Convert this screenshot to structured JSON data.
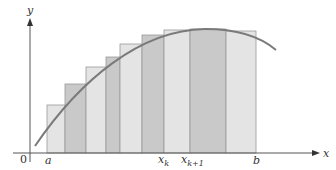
{
  "figure": {
    "axes": {
      "x_label": "x",
      "y_label": "y",
      "origin_label": "0"
    },
    "tick_labels": {
      "a": "a",
      "xk": "x",
      "xk_sub": "k",
      "xk1": "x",
      "xk1_sub": "k+1",
      "b": "b"
    },
    "colors": {
      "axis": "#555555",
      "curve": "#7a7a7a",
      "light_rect": "#e4e4e4",
      "dark_rect": "#c9c9c9",
      "rect_stroke": "#9a9a9a",
      "background": "#ffffff"
    },
    "rectangles": [
      {
        "x0": 47,
        "x1": 65,
        "top": 105,
        "shade": "light"
      },
      {
        "x0": 65,
        "x1": 86,
        "top": 84,
        "shade": "dark"
      },
      {
        "x0": 86,
        "x1": 106,
        "top": 67,
        "shade": "light"
      },
      {
        "x0": 106,
        "x1": 120,
        "top": 57,
        "shade": "dark"
      },
      {
        "x0": 120,
        "x1": 142,
        "top": 44,
        "shade": "light"
      },
      {
        "x0": 142,
        "x1": 164,
        "top": 35,
        "shade": "dark"
      },
      {
        "x0": 164,
        "x1": 190,
        "top": 30,
        "shade": "light"
      },
      {
        "x0": 190,
        "x1": 226,
        "top": 29,
        "shade": "dark"
      },
      {
        "x0": 226,
        "x1": 256,
        "top": 31,
        "shade": "light"
      }
    ]
  }
}
